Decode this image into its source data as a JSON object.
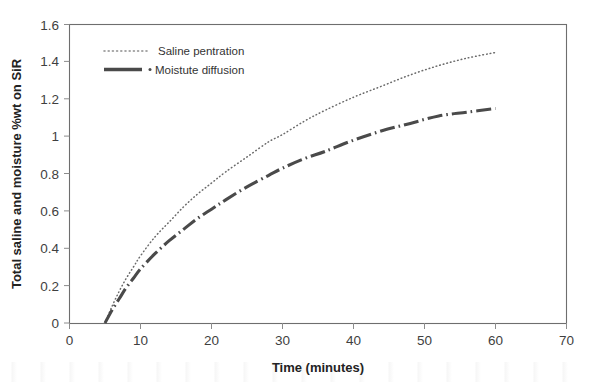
{
  "chart_data": {
    "type": "line",
    "title": "",
    "xlabel": "Time (minutes)",
    "ylabel": "Total saline and moisture %wt on SiR",
    "xlim": [
      0,
      70
    ],
    "ylim": [
      0,
      1.6
    ],
    "grid": false,
    "legend_position": "top-left-inside",
    "xticks": [
      "0",
      "10",
      "20",
      "30",
      "40",
      "50",
      "60",
      "70"
    ],
    "xtick_values": [
      0,
      10,
      20,
      30,
      40,
      50,
      60,
      70
    ],
    "yticks": [
      "0",
      "0.2",
      "0.4",
      "0.6",
      "0.8",
      "1",
      "1.2",
      "1.4",
      "1.6"
    ],
    "ytick_values": [
      0,
      0.2,
      0.4,
      0.6,
      0.8,
      1.0,
      1.2,
      1.4,
      1.6
    ],
    "x": [
      5,
      6,
      7,
      8,
      9,
      10,
      12,
      14,
      16,
      18,
      20,
      22,
      25,
      28,
      30,
      33,
      36,
      40,
      44,
      48,
      52,
      56,
      60
    ],
    "series": [
      {
        "name": "Saline pentration",
        "style": "dotted",
        "color": "#6a6a6a",
        "values": [
          0.0,
          0.09,
          0.17,
          0.24,
          0.3,
          0.36,
          0.46,
          0.54,
          0.62,
          0.69,
          0.75,
          0.81,
          0.89,
          0.97,
          1.01,
          1.08,
          1.14,
          1.21,
          1.27,
          1.33,
          1.38,
          1.42,
          1.45
        ]
      },
      {
        "name": "Moistute diffusion",
        "style": "dash-dot",
        "color": "#4a4a4a",
        "values": [
          0.0,
          0.07,
          0.13,
          0.19,
          0.24,
          0.29,
          0.37,
          0.44,
          0.5,
          0.56,
          0.61,
          0.66,
          0.73,
          0.79,
          0.83,
          0.88,
          0.92,
          0.98,
          1.03,
          1.07,
          1.11,
          1.13,
          1.15
        ]
      }
    ]
  },
  "legend": {
    "entries": [
      {
        "label": "Saline pentration",
        "marker": "dotted-line-swatch"
      },
      {
        "label": "Moistute diffusion",
        "marker": "dash-dot-line-swatch"
      }
    ]
  },
  "axes": {
    "x_title": "Time (minutes)",
    "y_title": "Total saline and moisture %wt on SiR"
  }
}
